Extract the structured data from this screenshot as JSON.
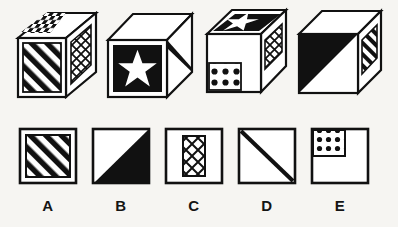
{
  "puzzle": {
    "type": "cube-folding-visual-reasoning",
    "background_color": "#f6f5f2",
    "ink_color": "#111111",
    "paper_color": "#ffffff"
  },
  "cubes": [
    {
      "id": "cube-1",
      "position": 1,
      "faces": {
        "top": "checkerboard",
        "front": "diagonal-stripes",
        "right": "crosshatch-lattice"
      }
    },
    {
      "id": "cube-2",
      "position": 2,
      "faces": {
        "top": "checkerboard",
        "front": "white-star-on-black",
        "right": "diagonal-line"
      }
    },
    {
      "id": "cube-3",
      "position": 3,
      "faces": {
        "top": "white-star-on-black",
        "front": "polka-dot-corner-square",
        "right": "crosshatch-lattice"
      }
    },
    {
      "id": "cube-4",
      "position": 4,
      "faces": {
        "top": "blank",
        "front": "black-triangle-half",
        "right": "diagonal-stripes"
      }
    }
  ],
  "options": [
    {
      "id": "option-a",
      "label": "A",
      "pattern": "diagonal-stripes-framed"
    },
    {
      "id": "option-b",
      "label": "B",
      "pattern": "black-triangle-lower-right"
    },
    {
      "id": "option-c",
      "label": "C",
      "pattern": "crosshatch-vertical-panel"
    },
    {
      "id": "option-d",
      "label": "D",
      "pattern": "single-diagonal-line"
    },
    {
      "id": "option-e",
      "label": "E",
      "pattern": "polka-dot-corner-square"
    }
  ]
}
